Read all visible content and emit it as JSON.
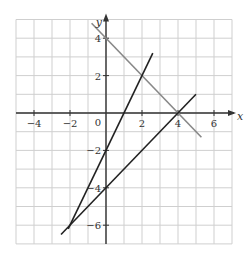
{
  "chart_data": {
    "type": "line",
    "title": "",
    "xlabel": "x",
    "ylabel": "y",
    "xlim": [
      -5,
      7
    ],
    "ylim": [
      -7,
      5
    ],
    "grid": true,
    "x_ticks": [
      -4,
      -2,
      0,
      2,
      4,
      6
    ],
    "y_ticks": [
      -6,
      -4,
      -2,
      2,
      4
    ],
    "x_tick_labels": [
      "−4",
      "−2",
      "0",
      "2",
      "4",
      "6"
    ],
    "y_tick_labels": [
      "−6",
      "−4",
      "−2",
      "2",
      "4"
    ],
    "origin_label": "0",
    "series": [
      {
        "name": "y = 4 − x",
        "color": "#888888",
        "x": [
          -0.8,
          5.3
        ],
        "y": [
          4.8,
          -1.3
        ]
      },
      {
        "name": "y = 2x − 2",
        "color": "#222222",
        "x": [
          -2.1,
          2.6
        ],
        "y": [
          -6.2,
          3.2
        ]
      },
      {
        "name": "y = x − 4",
        "color": "#222222",
        "x": [
          -2.5,
          5
        ],
        "y": [
          -6.5,
          1
        ]
      }
    ],
    "intersections": [
      {
        "x": 2,
        "y": 2
      },
      {
        "x": 4,
        "y": 0
      },
      {
        "x": -2,
        "y": -6
      }
    ]
  },
  "colors": {
    "grid": "#cfcfcf",
    "axis": "#333333"
  }
}
